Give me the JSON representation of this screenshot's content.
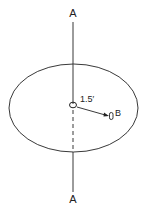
{
  "diagram": {
    "axis_label_top": "A",
    "axis_label_bottom": "A",
    "distance_label": "1.5′",
    "point_label": "B",
    "colors": {
      "stroke": "#222222",
      "background": "#ffffff"
    }
  }
}
